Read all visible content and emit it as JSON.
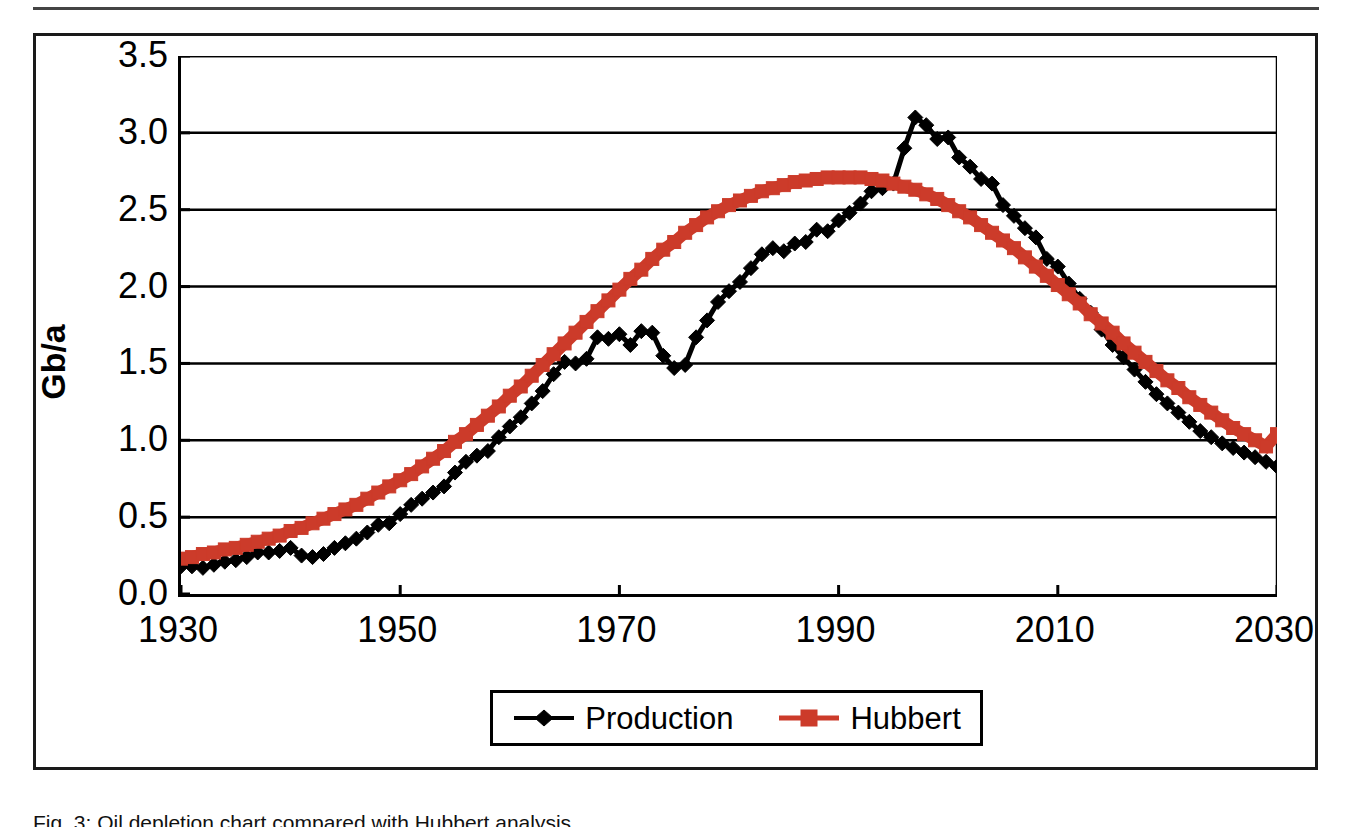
{
  "figure": {
    "caption": "Fig. 3: Oil depletion chart compared with Hubbert analysis",
    "y_axis_title": "Gb/a"
  },
  "legend": {
    "position": "bottom-center",
    "entries": [
      {
        "label": "Production",
        "color": "#000000",
        "marker": "diamond"
      },
      {
        "label": "Hubbert",
        "color": "#cc3b2a",
        "marker": "square"
      }
    ]
  },
  "chart_data": {
    "type": "line",
    "title": "",
    "subtitle": "",
    "xlabel": "",
    "ylabel": "Gb/a",
    "xlim": [
      1930,
      2030
    ],
    "ylim": [
      0.0,
      3.5
    ],
    "grid": true,
    "gridlines_horizontal": true,
    "gridlines_vertical": false,
    "xticks": [
      1930,
      1950,
      1970,
      1990,
      2010,
      2030
    ],
    "xtick_labels": [
      "1930",
      "1950",
      "1970",
      "1990",
      "2010",
      "2030"
    ],
    "yticks": [
      0.0,
      0.5,
      1.0,
      1.5,
      2.0,
      2.5,
      3.0,
      3.5
    ],
    "ytick_labels": [
      "0.0",
      "0.5",
      "1.0",
      "1.5",
      "2.0",
      "2.5",
      "3.0",
      "3.5"
    ],
    "legend_position": "bottom",
    "x": [
      1930,
      1931,
      1932,
      1933,
      1934,
      1935,
      1936,
      1937,
      1938,
      1939,
      1940,
      1941,
      1942,
      1943,
      1944,
      1945,
      1946,
      1947,
      1948,
      1949,
      1950,
      1951,
      1952,
      1953,
      1954,
      1955,
      1956,
      1957,
      1958,
      1959,
      1960,
      1961,
      1962,
      1963,
      1964,
      1965,
      1966,
      1967,
      1968,
      1969,
      1970,
      1971,
      1972,
      1973,
      1974,
      1975,
      1976,
      1977,
      1978,
      1979,
      1980,
      1981,
      1982,
      1983,
      1984,
      1985,
      1986,
      1987,
      1988,
      1989,
      1990,
      1991,
      1992,
      1993,
      1994,
      1995,
      1996,
      1997,
      1998,
      1999,
      2000,
      2001,
      2002,
      2003,
      2004,
      2005,
      2006,
      2007,
      2008,
      2009,
      2010,
      2011,
      2012,
      2013,
      2014,
      2015,
      2016,
      2017,
      2018,
      2019,
      2020,
      2021,
      2022,
      2023,
      2024,
      2025,
      2026,
      2027,
      2028,
      2029,
      2030
    ],
    "series": [
      {
        "name": "Production",
        "color": "#000000",
        "marker": "diamond",
        "values": [
          0.18,
          0.18,
          0.17,
          0.19,
          0.21,
          0.22,
          0.24,
          0.27,
          0.27,
          0.28,
          0.3,
          0.25,
          0.24,
          0.26,
          0.3,
          0.33,
          0.36,
          0.4,
          0.45,
          0.46,
          0.52,
          0.58,
          0.62,
          0.66,
          0.7,
          0.79,
          0.86,
          0.9,
          0.93,
          1.02,
          1.09,
          1.15,
          1.24,
          1.32,
          1.43,
          1.51,
          1.5,
          1.53,
          1.67,
          1.66,
          1.69,
          1.62,
          1.71,
          1.7,
          1.55,
          1.47,
          1.49,
          1.67,
          1.78,
          1.9,
          1.97,
          2.03,
          2.12,
          2.21,
          2.25,
          2.23,
          2.28,
          2.29,
          2.37,
          2.36,
          2.43,
          2.48,
          2.54,
          2.62,
          2.64,
          2.67,
          2.9,
          3.1,
          3.05,
          2.96,
          2.97,
          2.84,
          2.78,
          2.7,
          2.67,
          2.53,
          2.46,
          2.38,
          2.32,
          2.18,
          2.13,
          2.02,
          1.92,
          1.83,
          1.72,
          1.62,
          1.54,
          1.46,
          1.38,
          1.3,
          1.24,
          1.18,
          1.12,
          1.06,
          1.02,
          0.98,
          0.95,
          0.92,
          0.89,
          0.86,
          0.83
        ]
      },
      {
        "name": "Hubbert",
        "color": "#cc3b2a",
        "marker": "square",
        "values": [
          0.23,
          0.24,
          0.26,
          0.27,
          0.29,
          0.3,
          0.32,
          0.34,
          0.36,
          0.38,
          0.41,
          0.43,
          0.46,
          0.49,
          0.52,
          0.55,
          0.58,
          0.62,
          0.66,
          0.7,
          0.74,
          0.78,
          0.83,
          0.88,
          0.93,
          0.99,
          1.04,
          1.1,
          1.16,
          1.22,
          1.29,
          1.35,
          1.42,
          1.49,
          1.56,
          1.63,
          1.7,
          1.77,
          1.84,
          1.91,
          1.98,
          2.05,
          2.11,
          2.18,
          2.24,
          2.29,
          2.35,
          2.4,
          2.45,
          2.49,
          2.53,
          2.56,
          2.59,
          2.62,
          2.64,
          2.66,
          2.68,
          2.69,
          2.7,
          2.71,
          2.71,
          2.71,
          2.71,
          2.7,
          2.69,
          2.67,
          2.65,
          2.63,
          2.6,
          2.57,
          2.53,
          2.49,
          2.45,
          2.4,
          2.35,
          2.3,
          2.25,
          2.19,
          2.13,
          2.07,
          2.01,
          1.95,
          1.89,
          1.82,
          1.76,
          1.7,
          1.63,
          1.57,
          1.51,
          1.45,
          1.39,
          1.34,
          1.28,
          1.23,
          1.18,
          1.13,
          1.08,
          1.04,
          1.0,
          0.96,
          1.04
        ]
      }
    ]
  }
}
